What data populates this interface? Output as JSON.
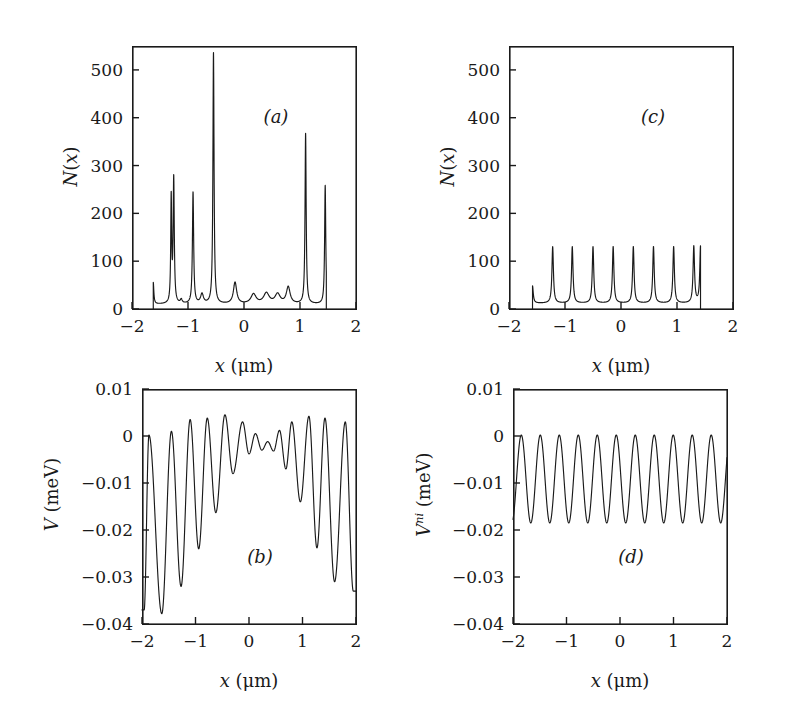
{
  "figure": {
    "background_color": "#ffffff",
    "ink_color": "#1a1a1a",
    "panel_count": 4
  },
  "panels": {
    "a": {
      "tag": "(a)",
      "xlabel_var": "x",
      "xlabel_unit": "(μm)",
      "ylabel": "N(x)",
      "xticklabels": [
        "-2",
        "-1",
        "0",
        "1",
        "2"
      ],
      "yticklabels": [
        "0",
        "100",
        "200",
        "300",
        "400",
        "500"
      ]
    },
    "b": {
      "tag": "(b)",
      "xlabel_var": "x",
      "xlabel_unit": "(μm)",
      "ylabel": "V (meV)",
      "xticklabels": [
        "-2",
        "-1",
        "0",
        "1",
        "2"
      ],
      "yticklabels": [
        "-0.04",
        "-0.03",
        "-0.02",
        "-0.01",
        "0",
        "0.01"
      ]
    },
    "c": {
      "tag": "(c)",
      "xlabel_var": "x",
      "xlabel_unit": "(μm)",
      "ylabel": "N(x)",
      "xticklabels": [
        "-2",
        "-1",
        "0",
        "1",
        "2"
      ],
      "yticklabels": [
        "0",
        "100",
        "200",
        "300",
        "400",
        "500"
      ]
    },
    "d": {
      "tag": "(d)",
      "xlabel_var": "V",
      "xlabel_unit": "(μm)",
      "ylabel": "V^ni (meV)",
      "xticklabels": [
        "-2",
        "-1",
        "0",
        "1",
        "2"
      ],
      "yticklabels": [
        "-0.04",
        "-0.03",
        "-0.02",
        "-0.01",
        "0",
        "0.01"
      ]
    }
  },
  "chart_data": [
    {
      "id": "a",
      "type": "line",
      "title": "(a)",
      "xlabel": "x (μm)",
      "ylabel": "N(x)",
      "xlim": [
        -2,
        2
      ],
      "ylim": [
        0,
        550
      ],
      "xticks": [
        -2,
        -1,
        0,
        1,
        2
      ],
      "yticks": [
        0,
        100,
        200,
        300,
        400,
        500
      ],
      "grid": false,
      "legend": null,
      "description": "Disordered electron density N(x): irregularly spaced sharp peaks of varying height over a low background, curve defined only between x=-1.62 and x=1.47.",
      "domain": [
        -1.62,
        1.47
      ],
      "baseline": 10,
      "peaks": [
        {
          "x": -1.62,
          "height": 55,
          "width": 0.012,
          "note": "left edge spike"
        },
        {
          "x": -1.3,
          "height": 228,
          "width": 0.01
        },
        {
          "x": -1.255,
          "height": 270,
          "width": 0.012
        },
        {
          "x": -1.12,
          "height": 18,
          "width": 0.02
        },
        {
          "x": -0.91,
          "height": 243,
          "width": 0.013
        },
        {
          "x": -0.75,
          "height": 30,
          "width": 0.03
        },
        {
          "x": -0.545,
          "height": 535,
          "width": 0.012
        },
        {
          "x": -0.16,
          "height": 55,
          "width": 0.035
        },
        {
          "x": 0.17,
          "height": 30,
          "width": 0.055
        },
        {
          "x": 0.4,
          "height": 32,
          "width": 0.06
        },
        {
          "x": 0.6,
          "height": 30,
          "width": 0.055
        },
        {
          "x": 0.79,
          "height": 45,
          "width": 0.04
        },
        {
          "x": 1.1,
          "height": 366,
          "width": 0.012
        },
        {
          "x": 1.45,
          "height": 258,
          "width": 0.012
        }
      ]
    },
    {
      "id": "b",
      "type": "line",
      "title": "(b)",
      "xlabel": "x (μm)",
      "ylabel": "V (meV)",
      "xlim": [
        -2,
        2
      ],
      "ylim": [
        -0.04,
        0.01
      ],
      "xticks": [
        -2,
        -1,
        0,
        1,
        2
      ],
      "yticks": [
        -0.04,
        -0.03,
        -0.02,
        -0.01,
        0,
        0.01
      ],
      "grid": false,
      "legend": null,
      "description": "Self-consistent potential V(x): oscillating curve whose amplitude is large near the edges (dipping to about -0.038 meV at x=-1.9) and strongly damped near the centre (about -0.004 to +0.002 meV around x=0.3).",
      "samples_hint": "maxima near 0.004 meV, minima deepening toward both edges",
      "maxima": [
        {
          "x": -1.87,
          "y": 0.0002
        },
        {
          "x": -1.45,
          "y": 0.001
        },
        {
          "x": -1.1,
          "y": 0.0035
        },
        {
          "x": -0.78,
          "y": 0.0038
        },
        {
          "x": -0.45,
          "y": 0.0045
        },
        {
          "x": -0.12,
          "y": 0.003
        },
        {
          "x": 0.12,
          "y": 0.0005
        },
        {
          "x": 0.35,
          "y": -0.0012
        },
        {
          "x": 0.57,
          "y": 0.0012
        },
        {
          "x": 0.8,
          "y": 0.003
        },
        {
          "x": 1.12,
          "y": 0.0042
        },
        {
          "x": 1.42,
          "y": 0.0038
        },
        {
          "x": 1.8,
          "y": 0.003
        }
      ],
      "minima": [
        {
          "x": -1.96,
          "y": -0.037
        },
        {
          "x": -1.63,
          "y": -0.0378
        },
        {
          "x": -1.27,
          "y": -0.032
        },
        {
          "x": -0.94,
          "y": -0.024
        },
        {
          "x": -0.62,
          "y": -0.0163
        },
        {
          "x": -0.3,
          "y": -0.008
        },
        {
          "x": 0.0,
          "y": -0.0038
        },
        {
          "x": 0.24,
          "y": -0.003
        },
        {
          "x": 0.46,
          "y": -0.0032
        },
        {
          "x": 0.69,
          "y": -0.007
        },
        {
          "x": 0.96,
          "y": -0.014
        },
        {
          "x": 1.27,
          "y": -0.0238
        },
        {
          "x": 1.6,
          "y": -0.031
        },
        {
          "x": 1.95,
          "y": -0.033
        }
      ]
    },
    {
      "id": "c",
      "type": "line",
      "title": "(c)",
      "xlabel": "x (μm)",
      "ylabel": "N(x)",
      "xlim": [
        -2,
        2
      ],
      "ylim": [
        0,
        550
      ],
      "xticks": [
        -2,
        -1,
        0,
        1,
        2
      ],
      "yticks": [
        0,
        100,
        200,
        300,
        400,
        500
      ],
      "grid": false,
      "legend": null,
      "description": "Non-interacting electron density N(x): eight regularly spaced identical sharp peaks of height about 130 on a low background, curve defined only between x=-1.58 and x=1.42.",
      "domain": [
        -1.58,
        1.42
      ],
      "baseline": 12,
      "peak_height": 130,
      "peak_width": 0.016,
      "peak_positions": [
        -1.22,
        -0.87,
        -0.5,
        -0.14,
        0.22,
        0.58,
        0.94,
        1.3
      ],
      "edge_spikes": [
        {
          "x": -1.58,
          "height": 48
        },
        {
          "x": 1.42,
          "height": 130
        }
      ]
    },
    {
      "id": "d",
      "type": "line",
      "title": "(d)",
      "xlabel": "x (μm)",
      "ylabel": "V^ni (meV)",
      "xlim": [
        -2,
        2
      ],
      "ylim": [
        -0.04,
        0.01
      ],
      "xticks": [
        -2,
        -1,
        0,
        1,
        2
      ],
      "yticks": [
        -0.04,
        -0.03,
        -0.02,
        -0.01,
        0,
        0.01
      ],
      "grid": false,
      "legend": null,
      "description": "Non-interacting potential V^ni(x): a perfectly regular sinusoidal oscillation of constant amplitude, maxima at about 0.0002 meV and minima at about -0.0185 meV, period about 0.355 μm, eleven full oscillations across the -2 to 2 μm range.",
      "wave": {
        "max_y": 0.0002,
        "min_y": -0.0185,
        "period": 0.355,
        "phase_max_x": -1.845,
        "n_oscillations": 11
      }
    }
  ]
}
